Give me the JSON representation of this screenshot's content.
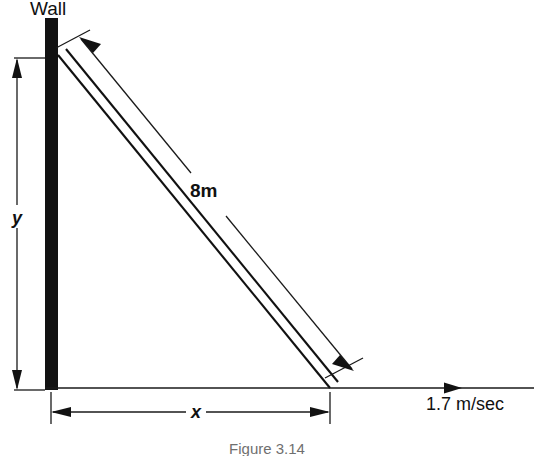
{
  "figure": {
    "caption": "Figure 3.14",
    "wall_label": "Wall",
    "ladder_length_label": "8m",
    "height_variable_label": "y",
    "base_variable_label": "x",
    "velocity_label": "1.7 m/sec",
    "ink_color": "#121212",
    "background_color": "#ffffff",
    "caption_color": "#6f6f6f"
  },
  "geometry": {
    "wall_x_left": 45,
    "wall_x_right": 58,
    "wall_top_y": 18,
    "wall_bottom_y": 390,
    "ground_y": 388,
    "ground_x_start": 45,
    "ground_x_end": 534,
    "ladder_top": [
      58,
      55
    ],
    "ladder_bottom": [
      330,
      388
    ],
    "velocity_arrow_tip_x": 462,
    "y_dimension_x": 17,
    "y_dimension_top": 58,
    "y_dimension_bottom": 390,
    "x_dimension_y": 412,
    "x_dimension_left": 50,
    "x_dimension_right": 330
  }
}
